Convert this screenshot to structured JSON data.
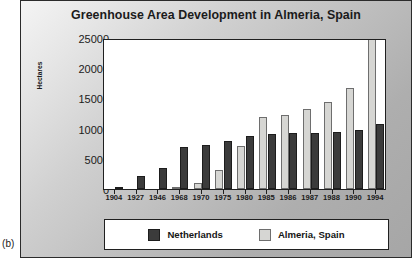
{
  "figure": {
    "subfigure_label": "(b)",
    "colors": {
      "netherlands": "#3b3b3b",
      "almeria": "#d6d6d3",
      "axis": "#202020",
      "plot_background": "#ffffff"
    }
  },
  "legend": {
    "position": "bottom",
    "entries": [
      {
        "label": "Netherlands",
        "swatch": "dark-gray-swatch-icon"
      },
      {
        "label": "Almeria, Spain",
        "swatch": "light-gray-swatch-icon"
      }
    ]
  },
  "chart_data": {
    "type": "bar",
    "title": "Greenhouse Area Development in Almeria, Spain",
    "xlabel": "",
    "ylabel": "Hectares",
    "ylim": [
      0,
      25000
    ],
    "yticks": [
      0,
      5000,
      10000,
      15000,
      20000,
      25000
    ],
    "ytick_labels": [
      "0",
      "5000",
      "10000",
      "15000",
      "20000",
      "25000"
    ],
    "grid": false,
    "legend_position": "bottom",
    "categories": [
      "1904",
      "1927",
      "1946",
      "1968",
      "1970",
      "1975",
      "1980",
      "1985",
      "1986",
      "1987",
      "1988",
      "1990",
      "1994"
    ],
    "series": [
      {
        "name": "Netherlands",
        "color": "#3b3b3b",
        "values": [
          200,
          2100,
          3400,
          7000,
          7300,
          8000,
          8800,
          9100,
          9200,
          9300,
          9400,
          9800,
          10800
        ]
      },
      {
        "name": "Almeria, Spain",
        "color": "#d6d6d3",
        "values": [
          0,
          0,
          0,
          100,
          1000,
          3100,
          7200,
          11900,
          12300,
          13200,
          14400,
          16700,
          25000
        ]
      }
    ],
    "annotations": [
      "1994 Almeria bar is clipped at the top of the axis (25000)"
    ]
  }
}
